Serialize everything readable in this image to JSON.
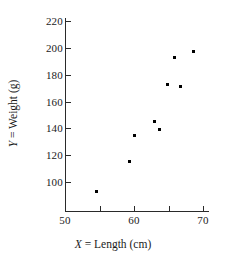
{
  "chart_data": {
    "type": "scatter",
    "title": "",
    "xlabel": "X = Length (cm)",
    "ylabel": "Y = Weight (g)",
    "xlabel_symbol": "X",
    "xlabel_rest": " = Length (cm)",
    "ylabel_symbol": "Y",
    "ylabel_rest": " = Weight (g)",
    "xlim": [
      48,
      71
    ],
    "ylim": [
      88,
      228
    ],
    "grid": false,
    "legend": "none",
    "x_ticks": [
      50,
      55,
      60,
      65,
      70
    ],
    "x_tick_labels": [
      "50",
      "",
      "60",
      "",
      "70"
    ],
    "y_ticks": [
      100,
      120,
      140,
      160,
      180,
      200,
      220
    ],
    "y_tick_labels": [
      "100",
      "120",
      "140",
      "160",
      "180",
      "200",
      "220"
    ],
    "marker": "square",
    "marker_color": "#000000",
    "axis_color": "#2a2a2a",
    "points": [
      {
        "x": 54.6,
        "y": 93
      },
      {
        "x": 59.3,
        "y": 115
      },
      {
        "x": 60.0,
        "y": 135
      },
      {
        "x": 62.9,
        "y": 145
      },
      {
        "x": 63.7,
        "y": 139
      },
      {
        "x": 64.8,
        "y": 173
      },
      {
        "x": 66.7,
        "y": 171
      },
      {
        "x": 65.9,
        "y": 193
      },
      {
        "x": 68.6,
        "y": 197
      }
    ]
  }
}
